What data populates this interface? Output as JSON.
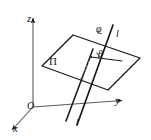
{
  "figure": {
    "kind": "3d-geometry-diagram",
    "background_color": "#ffffff",
    "stroke_color": "#1a1a1a",
    "width": 151,
    "height": 140
  },
  "axes": {
    "z": {
      "label": "z",
      "origin": [
        33,
        107
      ],
      "tip": [
        33,
        16
      ],
      "arrow": true
    },
    "y": {
      "label": "y",
      "origin": [
        33,
        107
      ],
      "tip": [
        126,
        100
      ],
      "arrow": true
    },
    "x": {
      "label": "x",
      "origin": [
        33,
        107
      ],
      "tip": [
        9,
        133
      ],
      "arrow": true
    },
    "origin": {
      "label": "O",
      "point": [
        33,
        107
      ]
    }
  },
  "plane": {
    "label": "Π",
    "label_point": [
      53,
      63
    ],
    "corners": [
      [
        73,
        35
      ],
      [
        140,
        58
      ],
      [
        108,
        90
      ],
      [
        42,
        66
      ]
    ]
  },
  "line_l": {
    "label_top": "l",
    "label_bottom": "l",
    "top_point": [
      113,
      26
    ],
    "bottom_point": [
      78,
      124
    ],
    "label_top_point": [
      119,
      34
    ],
    "label_bottom_point": [
      79,
      124
    ]
  },
  "projection_line": {
    "from": [
      91,
      57
    ],
    "to": [
      69,
      121
    ],
    "style": "solid"
  },
  "dashed_drop": {
    "from": [
      91,
      57
    ],
    "to": [
      80,
      80
    ],
    "style": "dashed"
  },
  "in_plane_ray": {
    "from": [
      91,
      57
    ],
    "to": [
      120,
      61
    ]
  },
  "angles": [
    {
      "name": "phi",
      "label": "φ",
      "label_point": [
        101,
        30
      ],
      "vertex": [
        91,
        57
      ]
    },
    {
      "name": "theta",
      "label": "θ",
      "label_point": [
        103,
        55
      ],
      "vertex": [
        91,
        57
      ]
    }
  ]
}
